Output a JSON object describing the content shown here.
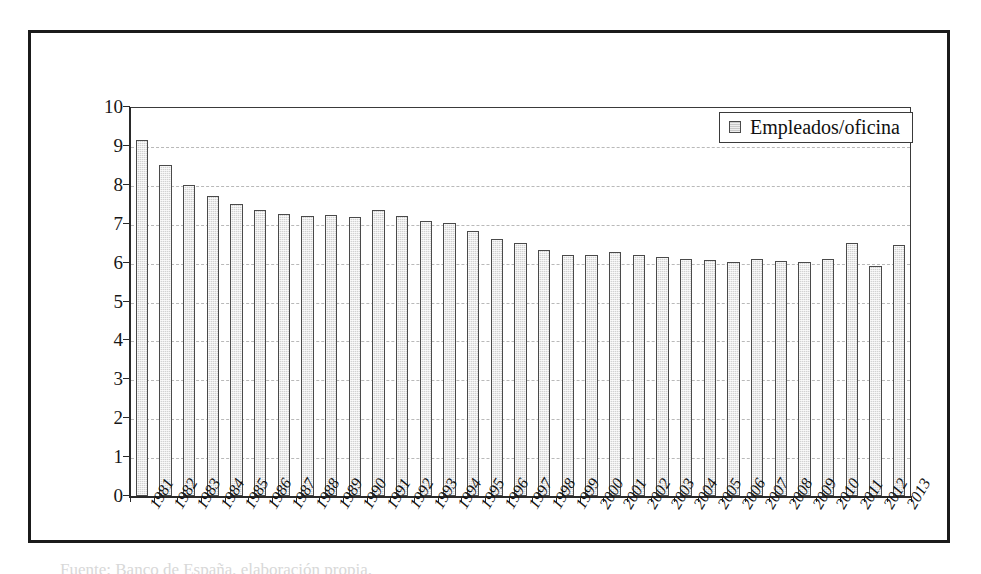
{
  "figure": {
    "caption_fragment": "Fuente: Banco de España, elaboración propia."
  },
  "legend": {
    "position": "top-right",
    "swatch_icon": "square-swatch-icon",
    "entries": [
      {
        "label": "Empleados/oficina",
        "color": "#c9c9c9"
      }
    ]
  },
  "axes": {
    "y_tick_labels": [
      "10",
      "9",
      "8",
      "7",
      "6",
      "5",
      "4",
      "3",
      "2",
      "1",
      "0"
    ],
    "x_tick_labels": [
      "1981",
      "1982",
      "1983",
      "1984",
      "1985",
      "1986",
      "1987",
      "1988",
      "1989",
      "1990",
      "1991",
      "1992",
      "1993",
      "1994",
      "1995",
      "1996",
      "1997",
      "1998",
      "1999",
      "2000",
      "2001",
      "2002",
      "2003",
      "2004",
      "2005",
      "2006",
      "2007",
      "2008",
      "2009",
      "2010",
      "2011",
      "2012",
      "2013"
    ]
  },
  "chart_data": {
    "type": "bar",
    "title": "",
    "subtitle": "",
    "xlabel": "",
    "ylabel": "",
    "ylim": [
      0,
      10
    ],
    "ytick_step": 1,
    "grid": true,
    "grid_style": "dashed-horizontal",
    "legend_position": "top-right",
    "bar_color": "#d2d2d2",
    "bar_edge_color": "#4a4a4a",
    "categories": [
      "1981",
      "1982",
      "1983",
      "1984",
      "1985",
      "1986",
      "1987",
      "1988",
      "1989",
      "1990",
      "1991",
      "1992",
      "1993",
      "1994",
      "1995",
      "1996",
      "1997",
      "1998",
      "1999",
      "2000",
      "2001",
      "2002",
      "2003",
      "2004",
      "2005",
      "2006",
      "2007",
      "2008",
      "2009",
      "2010",
      "2011",
      "2012",
      "2013"
    ],
    "series": [
      {
        "name": "Empleados/oficina",
        "values": [
          9.15,
          8.5,
          8.0,
          7.7,
          7.5,
          7.35,
          7.25,
          7.2,
          7.22,
          7.18,
          7.35,
          7.2,
          7.08,
          7.02,
          6.8,
          6.6,
          6.5,
          6.32,
          6.2,
          6.2,
          6.28,
          6.2,
          6.15,
          6.1,
          6.06,
          6.02,
          6.08,
          6.05,
          6.02,
          6.1,
          6.5,
          5.9,
          6.45
        ]
      }
    ]
  }
}
